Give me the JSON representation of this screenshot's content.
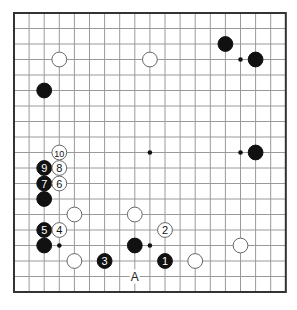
{
  "diagram": {
    "type": "go-board",
    "size": 19,
    "colors": {
      "background": "#ffffff",
      "grid": "#9a9a9a",
      "border": "#333333",
      "black": "#111111",
      "white": "#ffffff",
      "white_stroke": "#666666"
    },
    "star_points": [
      [
        3,
        3
      ],
      [
        9,
        3
      ],
      [
        15,
        3
      ],
      [
        3,
        9
      ],
      [
        9,
        9
      ],
      [
        15,
        9
      ],
      [
        3,
        15
      ],
      [
        9,
        15
      ],
      [
        15,
        15
      ]
    ],
    "stones": [
      {
        "col": 3,
        "row": 3,
        "color": "white",
        "label": ""
      },
      {
        "col": 9,
        "row": 3,
        "color": "white",
        "label": ""
      },
      {
        "col": 14,
        "row": 2,
        "color": "black",
        "label": ""
      },
      {
        "col": 16,
        "row": 3,
        "color": "black",
        "label": ""
      },
      {
        "col": 2,
        "row": 5,
        "color": "black",
        "label": ""
      },
      {
        "col": 16,
        "row": 9,
        "color": "black",
        "label": ""
      },
      {
        "col": 3,
        "row": 9,
        "color": "white",
        "label": "10"
      },
      {
        "col": 2,
        "row": 10,
        "color": "black",
        "label": "9"
      },
      {
        "col": 3,
        "row": 10,
        "color": "white",
        "label": "8"
      },
      {
        "col": 2,
        "row": 11,
        "color": "black",
        "label": "7"
      },
      {
        "col": 3,
        "row": 11,
        "color": "white",
        "label": "6"
      },
      {
        "col": 2,
        "row": 12,
        "color": "black",
        "label": ""
      },
      {
        "col": 4,
        "row": 13,
        "color": "white",
        "label": ""
      },
      {
        "col": 8,
        "row": 13,
        "color": "white",
        "label": ""
      },
      {
        "col": 2,
        "row": 14,
        "color": "black",
        "label": "5"
      },
      {
        "col": 3,
        "row": 14,
        "color": "white",
        "label": "4"
      },
      {
        "col": 10,
        "row": 14,
        "color": "white",
        "label": "2"
      },
      {
        "col": 2,
        "row": 15,
        "color": "black",
        "label": ""
      },
      {
        "col": 8,
        "row": 15,
        "color": "black",
        "label": ""
      },
      {
        "col": 15,
        "row": 15,
        "color": "white",
        "label": ""
      },
      {
        "col": 4,
        "row": 16,
        "color": "white",
        "label": ""
      },
      {
        "col": 6,
        "row": 16,
        "color": "black",
        "label": "3"
      },
      {
        "col": 10,
        "row": 16,
        "color": "black",
        "label": "1"
      },
      {
        "col": 12,
        "row": 16,
        "color": "white",
        "label": ""
      }
    ],
    "markers": [
      {
        "col": 8,
        "row": 17,
        "label": "A"
      }
    ]
  }
}
